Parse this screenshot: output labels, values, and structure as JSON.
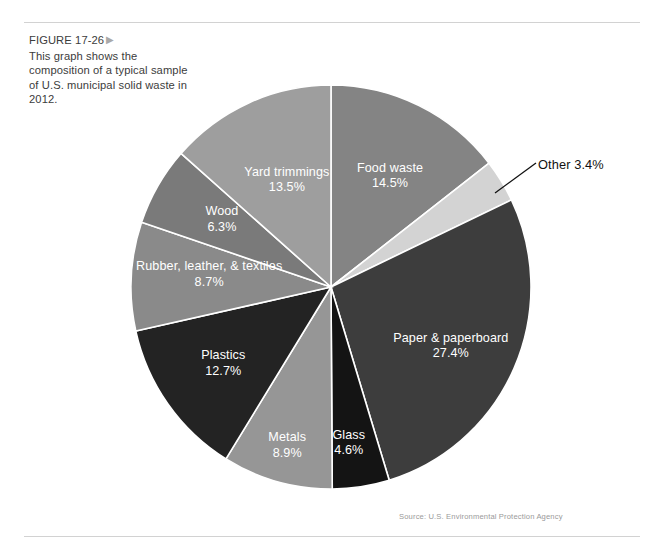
{
  "figure": {
    "label": "FIGURE 17-26",
    "arrow_icon": "triangle-right-icon",
    "caption": "This graph shows the composition of a typical sample of U.S. municipal solid waste in 2012."
  },
  "source_note": "Source: U.S. Environmental Protection Agency",
  "other_callout": {
    "text": "Other 3.4%",
    "leader_line": true
  },
  "chart_data": {
    "type": "pie",
    "title": "Composition of a typical sample of U.S. municipal solid waste in 2012",
    "subtitle": "",
    "xlabel": "",
    "ylabel": "",
    "units": "percent",
    "start_angle_deg": 0,
    "direction": "clockwise",
    "legend": "none",
    "labels_inside_slices": true,
    "categories": [
      "Food waste",
      "Other",
      "Paper & paperboard",
      "Glass",
      "Metals",
      "Plastics",
      "Rubber, leather, & textiles",
      "Wood",
      "Yard trimmings"
    ],
    "values": [
      14.5,
      3.4,
      27.4,
      4.6,
      8.9,
      12.7,
      8.7,
      6.3,
      13.5
    ],
    "value_labels": [
      "14.5%",
      "3.4%",
      "27.4%",
      "4.6%",
      "8.9%",
      "12.7%",
      "8.7%",
      "6.3%",
      "13.5%"
    ],
    "colors": [
      "#848484",
      "#d3d3d3",
      "#3d3d3d",
      "#141414",
      "#969696",
      "#232323",
      "#8a8a8a",
      "#7a7a7a",
      "#9e9e9e"
    ],
    "slices": [
      {
        "name": "Food waste",
        "value": 14.5,
        "value_label": "14.5%",
        "color": "#848484",
        "label_position": "inside"
      },
      {
        "name": "Other",
        "value": 3.4,
        "value_label": "3.4%",
        "color": "#d3d3d3",
        "label_position": "outside-callout"
      },
      {
        "name": "Paper & paperboard",
        "value": 27.4,
        "value_label": "27.4%",
        "color": "#3d3d3d",
        "label_position": "inside"
      },
      {
        "name": "Glass",
        "value": 4.6,
        "value_label": "4.6%",
        "color": "#141414",
        "label_position": "inside"
      },
      {
        "name": "Metals",
        "value": 8.9,
        "value_label": "8.9%",
        "color": "#969696",
        "label_position": "inside"
      },
      {
        "name": "Plastics",
        "value": 12.7,
        "value_label": "12.7%",
        "color": "#232323",
        "label_position": "inside"
      },
      {
        "name": "Rubber, leather, & textiles",
        "value": 8.7,
        "value_label": "8.7%",
        "color": "#8a8a8a",
        "label_position": "inside"
      },
      {
        "name": "Wood",
        "value": 6.3,
        "value_label": "6.3%",
        "color": "#7a7a7a",
        "label_position": "inside"
      },
      {
        "name": "Yard trimmings",
        "value": 13.5,
        "value_label": "13.5%",
        "color": "#9e9e9e",
        "label_position": "inside"
      }
    ]
  }
}
